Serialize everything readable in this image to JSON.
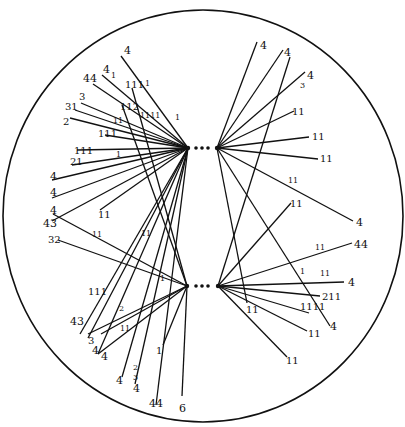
{
  "diagram": {
    "boundary": {
      "cx": 203,
      "cy": 216,
      "rx": 200,
      "ry": 206
    },
    "colors": {
      "ink": "#111111",
      "background": "#ffffff"
    },
    "hubs": [
      {
        "id": "upper-left",
        "x": 188,
        "y": 148
      },
      {
        "id": "upper-right",
        "x": 217,
        "y": 148
      },
      {
        "id": "lower-left",
        "x": 187,
        "y": 286
      },
      {
        "id": "lower-right",
        "x": 218,
        "y": 286
      }
    ],
    "connector_dots": [
      {
        "x": 196,
        "y": 148
      },
      {
        "x": 202,
        "y": 148
      },
      {
        "x": 208,
        "y": 148
      },
      {
        "x": 196,
        "y": 286
      },
      {
        "x": 202,
        "y": 286
      },
      {
        "x": 208,
        "y": 286
      }
    ],
    "edges": [
      {
        "hub": "upper-left",
        "x": 121,
        "y": 56,
        "label": "4",
        "lx": 124,
        "ly": 54,
        "big": true
      },
      {
        "hub": "upper-left",
        "x": 102,
        "y": 75,
        "label": "4",
        "lx": 103,
        "ly": 73,
        "big": true
      },
      {
        "hub": "upper-left",
        "x": 93,
        "y": 84,
        "label": "44",
        "lx": 83,
        "ly": 82,
        "big": true
      },
      {
        "hub": "upper-left",
        "x": 81,
        "y": 103,
        "label": "3",
        "lx": 79,
        "ly": 100
      },
      {
        "hub": "upper-left",
        "x": 75,
        "y": 110,
        "label": "31",
        "lx": 65,
        "ly": 110
      },
      {
        "hub": "upper-left",
        "x": 70,
        "y": 118,
        "label": "2",
        "lx": 63,
        "ly": 125
      },
      {
        "hub": "upper-left",
        "x": 105,
        "y": 135,
        "label": "111",
        "lx": 98,
        "ly": 137
      },
      {
        "hub": "upper-left",
        "x": 77,
        "y": 150,
        "label": "111",
        "lx": 74,
        "ly": 154
      },
      {
        "hub": "upper-left",
        "x": 72,
        "y": 165,
        "label": "21",
        "lx": 70,
        "ly": 165
      },
      {
        "hub": "upper-left",
        "x": 52,
        "y": 180,
        "label": "4",
        "lx": 50,
        "ly": 180,
        "big": true
      },
      {
        "hub": "upper-left",
        "x": 52,
        "y": 198,
        "label": "4",
        "lx": 50,
        "ly": 196,
        "big": true
      },
      {
        "hub": "upper-left",
        "x": 52,
        "y": 221,
        "label": "4",
        "lx": 50,
        "ly": 214,
        "big": true
      },
      {
        "hub": "upper-left",
        "x": 100,
        "y": 210,
        "label": "11",
        "lx": 98,
        "ly": 218
      },
      {
        "hub": "lower-left",
        "x": 132,
        "y": 88,
        "label": "111",
        "lx": 125,
        "ly": 88
      },
      {
        "hub": "lower-left",
        "x": 122,
        "y": 105,
        "label": "112",
        "lx": 120,
        "ly": 110
      },
      {
        "hub": "lower-left",
        "x": 53,
        "y": 214,
        "label": "43",
        "lx": 43,
        "ly": 227,
        "big": true
      },
      {
        "hub": "lower-left",
        "x": 58,
        "y": 240,
        "label": "32",
        "lx": 48,
        "ly": 243
      },
      {
        "hub": "lower-left",
        "x": 101,
        "y": 334,
        "label": "111",
        "lx": 88,
        "ly": 295
      },
      {
        "hub": "upper-left",
        "x": 80,
        "y": 334,
        "label": "43",
        "lx": 70,
        "ly": 325,
        "big": true
      },
      {
        "hub": "upper-left",
        "x": 88,
        "y": 338,
        "label": "3",
        "lx": 88,
        "ly": 344
      },
      {
        "hub": "lower-left",
        "x": 88,
        "y": 334,
        "label": "",
        "lx": 0,
        "ly": 0
      },
      {
        "hub": "upper-left",
        "x": 98,
        "y": 354,
        "label": "4",
        "lx": 92,
        "ly": 354,
        "big": true
      },
      {
        "hub": "lower-left",
        "x": 98,
        "y": 354,
        "label": "4",
        "lx": 101,
        "ly": 360,
        "big": true
      },
      {
        "hub": "upper-left",
        "x": 122,
        "y": 377,
        "label": "4",
        "lx": 116,
        "ly": 384,
        "big": true
      },
      {
        "hub": "upper-left",
        "x": 135,
        "y": 384,
        "label": "4",
        "lx": 133,
        "ly": 392,
        "big": true
      },
      {
        "hub": "upper-left",
        "x": 156,
        "y": 405,
        "label": "44",
        "lx": 149,
        "ly": 407,
        "big": true
      },
      {
        "hub": "lower-left",
        "x": 163,
        "y": 345,
        "label": "1",
        "lx": 156,
        "ly": 354
      },
      {
        "hub": "lower-left",
        "x": 182,
        "y": 396,
        "label": "6",
        "lx": 179,
        "ly": 412,
        "big": true
      },
      {
        "hub": "upper-right",
        "x": 257,
        "y": 42,
        "label": "4",
        "lx": 260,
        "ly": 49,
        "big": true
      },
      {
        "hub": "upper-right",
        "x": 283,
        "y": 50,
        "label": "4",
        "lx": 284,
        "ly": 56,
        "big": true
      },
      {
        "hub": "upper-right",
        "x": 305,
        "y": 72,
        "label": "4",
        "lx": 307,
        "ly": 79,
        "big": true
      },
      {
        "hub": "upper-right",
        "x": 294,
        "y": 111,
        "label": "11",
        "lx": 292,
        "ly": 115
      },
      {
        "hub": "upper-right",
        "x": 309,
        "y": 137,
        "label": "11",
        "lx": 312,
        "ly": 140
      },
      {
        "hub": "upper-right",
        "x": 318,
        "y": 159,
        "label": "11",
        "lx": 320,
        "ly": 162
      },
      {
        "hub": "upper-right",
        "x": 353,
        "y": 221,
        "label": "4",
        "lx": 356,
        "ly": 226,
        "big": true
      },
      {
        "hub": "upper-right",
        "x": 247,
        "y": 303,
        "label": "11",
        "lx": 246,
        "ly": 313
      },
      {
        "hub": "upper-right",
        "x": 330,
        "y": 326,
        "label": "4",
        "lx": 330,
        "ly": 330,
        "big": true
      },
      {
        "hub": "lower-right",
        "x": 290,
        "y": 57,
        "label": "",
        "lx": 0,
        "ly": 0
      },
      {
        "hub": "lower-right",
        "x": 291,
        "y": 203,
        "label": "11",
        "lx": 290,
        "ly": 207
      },
      {
        "hub": "lower-right",
        "x": 352,
        "y": 243,
        "label": "44",
        "lx": 354,
        "ly": 248,
        "big": true
      },
      {
        "hub": "lower-right",
        "x": 344,
        "y": 282,
        "label": "4",
        "lx": 348,
        "ly": 286,
        "big": true
      },
      {
        "hub": "lower-right",
        "x": 320,
        "y": 296,
        "label": "211",
        "lx": 322,
        "ly": 300
      },
      {
        "hub": "lower-right",
        "x": 309,
        "y": 313,
        "label": "1111",
        "lx": 300,
        "ly": 310
      },
      {
        "hub": "lower-right",
        "x": 307,
        "y": 331,
        "label": "11",
        "lx": 308,
        "ly": 337
      },
      {
        "hub": "lower-right",
        "x": 287,
        "y": 357,
        "label": "11",
        "lx": 286,
        "ly": 364
      }
    ],
    "midline_marks": [
      {
        "text": "1",
        "x": 111,
        "y": 78
      },
      {
        "text": "1",
        "x": 145,
        "y": 86
      },
      {
        "text": "1111",
        "x": 140,
        "y": 118
      },
      {
        "text": "1",
        "x": 175,
        "y": 120
      },
      {
        "text": "11",
        "x": 113,
        "y": 123
      },
      {
        "text": "1",
        "x": 116,
        "y": 157
      },
      {
        "text": "11",
        "x": 92,
        "y": 237
      },
      {
        "text": "11",
        "x": 141,
        "y": 236
      },
      {
        "text": "2",
        "x": 119,
        "y": 311
      },
      {
        "text": "11",
        "x": 120,
        "y": 331
      },
      {
        "text": "1",
        "x": 160,
        "y": 281
      },
      {
        "text": "2",
        "x": 133,
        "y": 370
      },
      {
        "text": "3",
        "x": 133,
        "y": 380
      },
      {
        "text": "11",
        "x": 288,
        "y": 183
      },
      {
        "text": "11",
        "x": 315,
        "y": 250
      },
      {
        "text": "1",
        "x": 300,
        "y": 274
      },
      {
        "text": "11",
        "x": 320,
        "y": 276
      },
      {
        "text": "3",
        "x": 300,
        "y": 88
      }
    ]
  }
}
